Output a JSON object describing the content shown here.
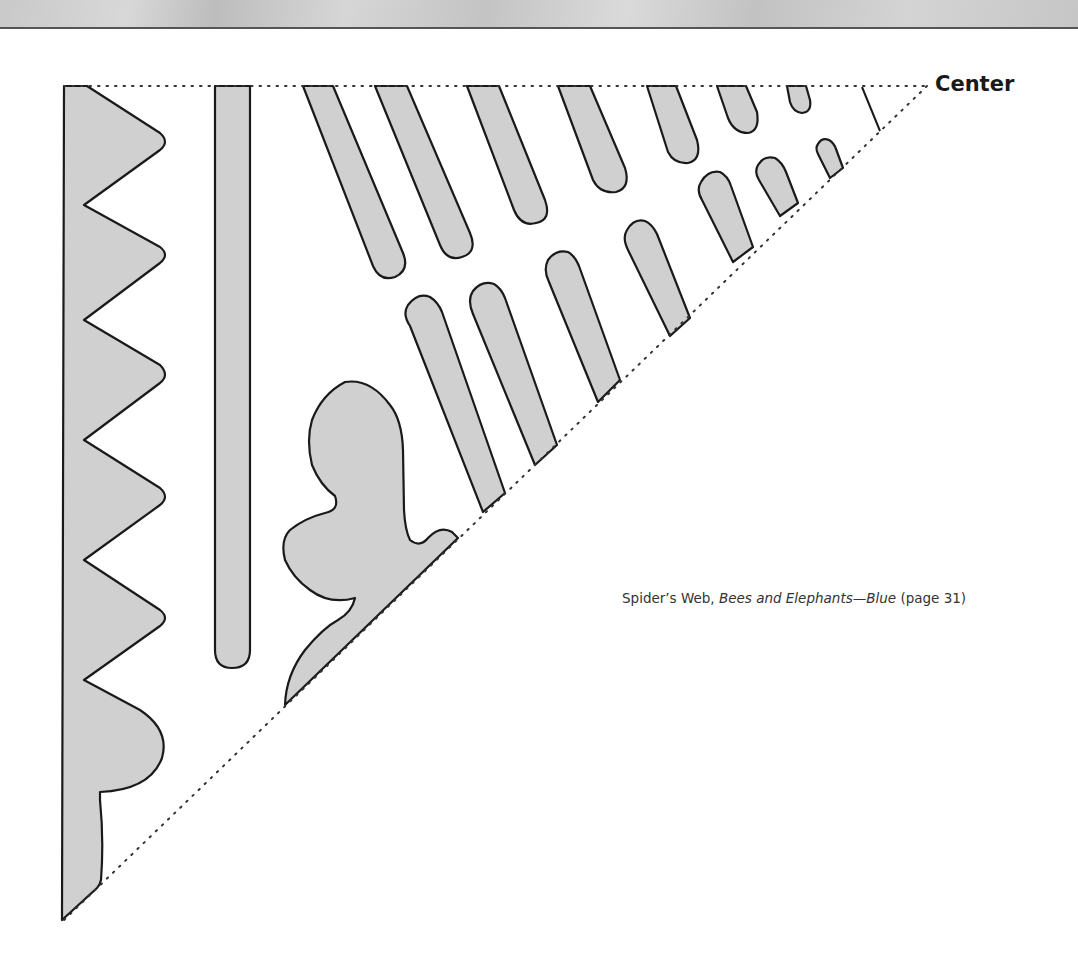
{
  "page": {
    "center_label": "Center",
    "caption": {
      "prefix": "Spider’s Web, ",
      "title_italic": "Bees and Elephants—Blue",
      "suffix": " (page 31)"
    }
  },
  "template_colors": {
    "fill": "#d0d0d0",
    "outline": "#1a1a1a",
    "fold_line": "#333333",
    "header_band": "#c8c8c8"
  }
}
